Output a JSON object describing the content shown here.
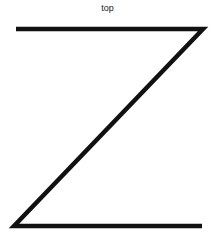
{
  "diagram": {
    "label_top": "top",
    "shape": "Z",
    "stroke_color": "#111111",
    "background": "#ffffff",
    "segments": [
      {
        "name": "top-bar",
        "x1": 16,
        "y1": 29,
        "x2": 203,
        "y2": 29
      },
      {
        "name": "diagonal",
        "x1": 203,
        "y1": 29,
        "x2": 14,
        "y2": 226
      },
      {
        "name": "bottom-bar",
        "x1": 14,
        "y1": 226,
        "x2": 202,
        "y2": 226
      }
    ]
  }
}
